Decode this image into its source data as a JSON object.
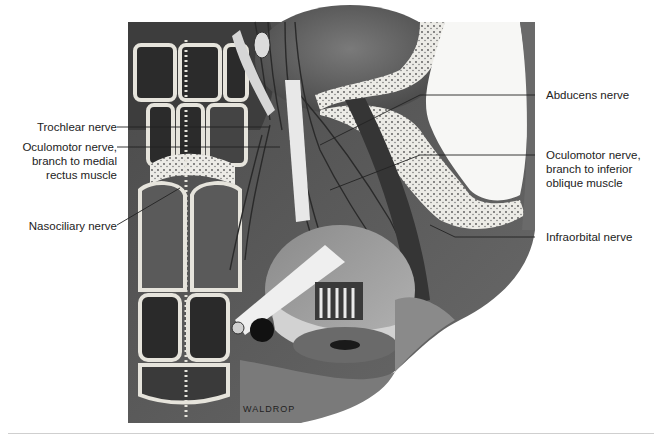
{
  "figure": {
    "signature": "WALDROP",
    "colors": {
      "background": "#ffffff",
      "illustration_dark": "#3a3a3a",
      "illustration_mid": "#6e6e6e",
      "illustration_light": "#d8d8d8",
      "bone_light": "#ecebe6",
      "label_text": "#222222",
      "leader_line": "#222222",
      "bottom_rule": "#cfcfcf"
    }
  },
  "labels": {
    "left": [
      {
        "id": "trochlear",
        "lines": [
          "Trochlear nerve"
        ]
      },
      {
        "id": "oculomotor-medial",
        "lines": [
          "Oculomotor nerve,",
          "branch to medial",
          "rectus muscle"
        ]
      },
      {
        "id": "nasociliary",
        "lines": [
          "Nasociliary nerve"
        ]
      }
    ],
    "right": [
      {
        "id": "abducens",
        "lines": [
          "Abducens nerve"
        ]
      },
      {
        "id": "oculomotor-inferior",
        "lines": [
          "Oculomotor nerve,",
          "branch to inferior",
          "oblique muscle"
        ]
      },
      {
        "id": "infraorbital",
        "lines": [
          "Infraorbital nerve"
        ]
      }
    ]
  }
}
